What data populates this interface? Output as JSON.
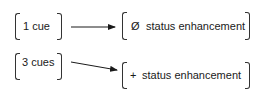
{
  "diagram": {
    "nodes": [
      {
        "id": "one-cue",
        "label": "1 cue"
      },
      {
        "id": "three-cues",
        "label": "3 cues"
      },
      {
        "id": "no-enhancement",
        "symbol": "Ø",
        "label": "status enhancement"
      },
      {
        "id": "plus-enhancement",
        "symbol": "+",
        "label": "status enhancement"
      }
    ],
    "edges": [
      {
        "from": "one-cue",
        "to": "no-enhancement"
      },
      {
        "from": "three-cues",
        "to": "plus-enhancement"
      }
    ]
  }
}
